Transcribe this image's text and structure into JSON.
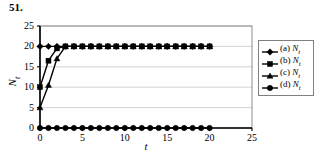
{
  "problem": {
    "number": "51."
  },
  "chart_data": {
    "type": "line",
    "title": "",
    "subtitle": "",
    "xlabel": "t",
    "ylabel": "N_t",
    "xlim": [
      0,
      25
    ],
    "ylim": [
      0,
      25
    ],
    "xticks": [
      0,
      5,
      10,
      15,
      20,
      25
    ],
    "yticks": [
      0,
      5,
      10,
      15,
      20,
      25
    ],
    "grid": "horizontal",
    "legend_position": "right",
    "x": [
      0,
      1,
      2,
      3,
      4,
      5,
      6,
      7,
      8,
      9,
      10,
      11,
      12,
      13,
      14,
      15,
      16,
      17,
      18,
      19,
      20
    ],
    "series": [
      {
        "name": "(a) N_t",
        "label_prefix": "(a) ",
        "label_var": "N_t",
        "marker": "diamond",
        "color": "#000000",
        "values": [
          20,
          20,
          20,
          20,
          20,
          20,
          20,
          20,
          20,
          20,
          20,
          20,
          20,
          20,
          20,
          20,
          20,
          20,
          20,
          20,
          20
        ]
      },
      {
        "name": "(b) N_t",
        "label_prefix": "(b) ",
        "label_var": "N_t",
        "marker": "square",
        "color": "#000000",
        "values": [
          10,
          16.5,
          19.5,
          20,
          20,
          20,
          20,
          20,
          20,
          20,
          20,
          20,
          20,
          20,
          20,
          20,
          20,
          20,
          20,
          20,
          20
        ]
      },
      {
        "name": "(c) N_t",
        "label_prefix": "(c) ",
        "label_var": "N_t",
        "marker": "triangle",
        "color": "#000000",
        "values": [
          5,
          10.5,
          17,
          20,
          20,
          20,
          20,
          20,
          20,
          20,
          20,
          20,
          20,
          20,
          20,
          20,
          20,
          20,
          20,
          20,
          20
        ]
      },
      {
        "name": "(d) N_t",
        "label_prefix": "(d) ",
        "label_var": "N_t",
        "marker": "circle",
        "color": "#000000",
        "values": [
          0,
          0,
          0,
          0,
          0,
          0,
          0,
          0,
          0,
          0,
          0,
          0,
          0,
          0,
          0,
          0,
          0,
          0,
          0,
          0,
          0
        ]
      }
    ]
  },
  "axis": {
    "y_tick_labels": [
      "0",
      "5",
      "10",
      "15",
      "20",
      "25"
    ],
    "x_tick_labels": [
      "0",
      "5",
      "10",
      "15",
      "20",
      "25"
    ],
    "y_title": "N_t",
    "x_title": "t"
  },
  "legend": {
    "entries": [
      {
        "label": "(a) N_t",
        "marker": "diamond"
      },
      {
        "label": "(b) N_t",
        "marker": "square"
      },
      {
        "label": "(c) N_t",
        "marker": "triangle"
      },
      {
        "label": "(d) N_t",
        "marker": "circle"
      }
    ]
  },
  "colors": {
    "series": "#000000",
    "grid": "#c8c8c8",
    "axis": "#000000",
    "legend_border": "#808080",
    "background": "#ffffff"
  }
}
